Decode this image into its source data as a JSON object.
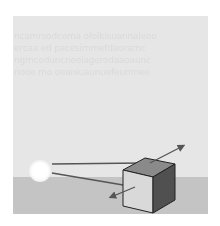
{
  "diagram": {
    "background_text_lines": [
      "ncamrsodcoma ofolkisuannaleoo",
      "ercaa ed pacesimmefdaoramc",
      "ngmcoduncneeiagerodaaoaunc",
      "nooe mo oeaniuaunuefeumnee"
    ],
    "elements": {
      "light_source": {
        "label": "light-source",
        "color": "#ffffff"
      },
      "cube": {
        "front_color": "#d9d9d9",
        "top_color": "#8a8a8a",
        "side_color": "#505050",
        "outline": "#222222"
      },
      "rays": [
        {
          "name": "incident-ray-top",
          "color": "#555555"
        },
        {
          "name": "incident-ray-front",
          "color": "#555555"
        },
        {
          "name": "reflected-ray-up",
          "color": "#555555"
        },
        {
          "name": "scattered-ray-down",
          "color": "#555555"
        }
      ],
      "ground": {
        "color": "#c4c4c4"
      },
      "sky": {
        "color": "#e6e6e6"
      }
    }
  }
}
